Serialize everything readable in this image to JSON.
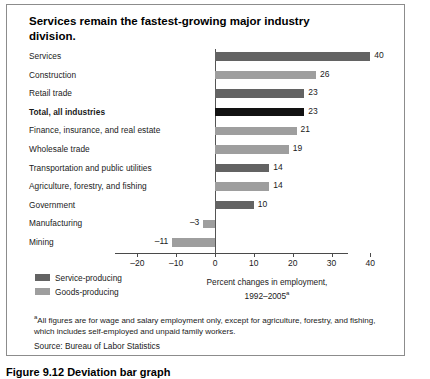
{
  "figure": {
    "title": "Services remain the fastest-growing major industry division.",
    "caption": "Figure 9.12  Deviation bar graph"
  },
  "legend": {
    "items": [
      {
        "label": "Service-producing",
        "shade": "svc",
        "color": "#636363"
      },
      {
        "label": "Goods-producing",
        "shade": "goods",
        "color": "#9e9e9e"
      }
    ]
  },
  "notes": {
    "footnote_marker": "a",
    "footnote": "All figures are for wage and salary employment only, except for agriculture, forestry, and fishing, which includes self-employed and unpaid family workers.",
    "source": "Source: Bureau of Labor Statistics"
  },
  "chart_data": {
    "type": "bar",
    "orientation": "horizontal",
    "title": "Services remain the fastest-growing major industry division.",
    "xlabel": "Percent changes in employment, 1992–2005",
    "xlabel_line1": "Percent changes in employment,",
    "xlabel_line2": "1992–2005",
    "xlabel_sup": "a",
    "ylabel": "",
    "xlim": [
      -20,
      40
    ],
    "xticks": [
      -20,
      -10,
      0,
      10,
      20,
      30,
      40
    ],
    "xticklabels": [
      "–20",
      "–10",
      "0",
      "10",
      "20",
      "30",
      "40"
    ],
    "grid": false,
    "legend_position": "bottom-left",
    "categories": [
      "Services",
      "Construction",
      "Retail trade",
      "Total, all industries",
      "Finance, insurance, and real estate",
      "Wholesale trade",
      "Transportation and public utilities",
      "Agriculture, forestry, and fishing",
      "Government",
      "Manufacturing",
      "Mining"
    ],
    "values": [
      40,
      26,
      23,
      23,
      21,
      19,
      14,
      14,
      10,
      -3,
      -11
    ],
    "value_labels": [
      "40",
      "26",
      "23",
      "23",
      "21",
      "19",
      "14",
      "14",
      "10",
      "–3",
      "–11"
    ],
    "series_group": [
      "service",
      "goods",
      "service",
      "total",
      "goods",
      "goods",
      "service",
      "goods",
      "service",
      "goods",
      "goods"
    ],
    "bar_shades": [
      "svc",
      "goods",
      "svc",
      "total",
      "goods",
      "goods",
      "svc",
      "goods",
      "svc",
      "goods",
      "goods"
    ],
    "bold_categories": [
      "Total, all industries"
    ],
    "colors": {
      "service_producing": "#636363",
      "goods_producing": "#9e9e9e",
      "total": "#121212"
    }
  }
}
